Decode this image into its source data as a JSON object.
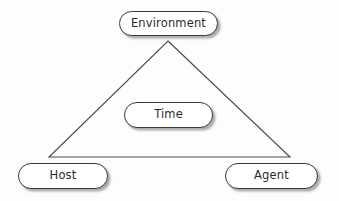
{
  "diagram": {
    "background_color": "#fdfdfd",
    "stroke_color": "#3a3a3a",
    "text_color": "#2b2b2b",
    "shadow_color": "#5a5a5a",
    "shape": {
      "type": "triangle",
      "apex": {
        "x": 168,
        "y": 41
      },
      "bottom_left": {
        "x": 49,
        "y": 157
      },
      "bottom_right": {
        "x": 290,
        "y": 157
      }
    },
    "nodes": [
      {
        "id": "environment",
        "label": "Environment",
        "position": "apex-top",
        "x": 119,
        "y": 11,
        "width": 99,
        "height": 25
      },
      {
        "id": "time",
        "label": "Time",
        "position": "center",
        "x": 124,
        "y": 102,
        "width": 89,
        "height": 26
      },
      {
        "id": "host",
        "label": "Host",
        "position": "bottom-left",
        "x": 18,
        "y": 163,
        "width": 90,
        "height": 26
      },
      {
        "id": "agent",
        "label": "Agent",
        "position": "bottom-right",
        "x": 225,
        "y": 163,
        "width": 93,
        "height": 26
      }
    ]
  }
}
